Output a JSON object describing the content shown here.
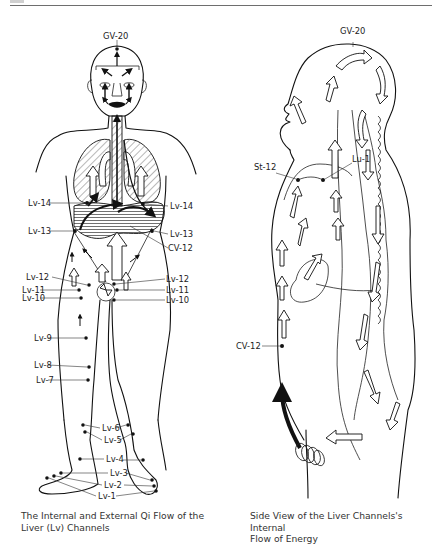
{
  "page": {
    "top_rule": true
  },
  "figures": [
    {
      "id": "front",
      "caption_line1": "The Internal and External Qi Flow of the",
      "caption_line2": "Liver (Lv) Channels",
      "labels": {
        "gv20": "GV-20",
        "lv14_left": "Lv-14",
        "lv14_right": "Lv-14",
        "lv13_left": "Lv-13",
        "lv13_right": "Lv-13",
        "cv12": "CV-12",
        "lv12_left": "Lv-12",
        "lv11_left": "Lv-11",
        "lv10_left": "Lv-10",
        "lv12_right": "Lv-12",
        "lv11_right": "Lv-11",
        "lv10_right": "Lv-10",
        "lv9": "Lv-9",
        "lv8": "Lv-8",
        "lv7": "Lv-7",
        "lv6": "Lv-6",
        "lv5": "Lv-5",
        "lv4": "Lv-4",
        "lv3": "Lv-3",
        "lv2": "Lv-2",
        "lv1": "Lv-1"
      }
    },
    {
      "id": "side",
      "caption_line1": "Side View of the Liver Channels's Internal",
      "caption_line2": "Flow of Energy",
      "labels": {
        "gv20": "GV-20",
        "st12": "St-12",
        "lu1": "Lu-1",
        "cv12": "CV-12"
      }
    }
  ],
  "icons": {
    "flow_arrow_hollow": "hollow-arrow",
    "flow_arrow_solid": "solid-arrow",
    "acupoint": "dot"
  },
  "colors": {
    "ink": "#111111",
    "caption": "#333333",
    "rule": "#6e6e6e",
    "background": "#ffffff"
  }
}
